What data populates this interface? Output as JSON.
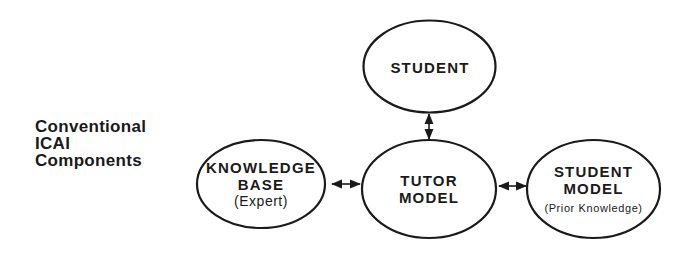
{
  "title": {
    "lines": [
      "Conventional",
      "ICAI",
      "Components"
    ]
  },
  "nodes": {
    "student": {
      "label_lines": [
        "STUDENT"
      ]
    },
    "knowledge_base": {
      "label_lines": [
        "KNOWLEDGE",
        "BASE"
      ],
      "sub_label": "(Expert)"
    },
    "tutor_model": {
      "label_lines": [
        "TUTOR",
        "MODEL"
      ]
    },
    "student_model": {
      "label_lines": [
        "STUDENT",
        "MODEL"
      ],
      "sub_label": "(Prior Knowledge)"
    }
  },
  "edges": [
    {
      "from": "student",
      "to": "tutor_model",
      "type": "bidirectional"
    },
    {
      "from": "knowledge_base",
      "to": "tutor_model",
      "type": "bidirectional"
    },
    {
      "from": "tutor_model",
      "to": "student_model",
      "type": "bidirectional"
    }
  ],
  "colors": {
    "stroke": "#1a1a1a",
    "background": "#ffffff"
  }
}
